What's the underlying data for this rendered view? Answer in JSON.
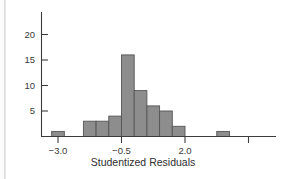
{
  "figure": {
    "background": "#ffffff",
    "width": 285,
    "height": 179
  },
  "chart_data": {
    "type": "bar",
    "subtype": "histogram",
    "title": "",
    "xlabel": "Studentized Residuals",
    "ylabel": "",
    "xlim": [
      -3.6,
      5.2
    ],
    "ylim": [
      0,
      21
    ],
    "grid": false,
    "legend": null,
    "bin_width": 0.5,
    "bin_starts": [
      -3.25,
      -2.0,
      -1.5,
      -1.0,
      -0.5,
      0.0,
      0.5,
      1.0,
      1.5,
      3.25
    ],
    "bin_centers": [
      -3.0,
      -1.75,
      -1.25,
      -0.75,
      -0.25,
      0.25,
      0.75,
      1.25,
      1.75,
      3.5
    ],
    "values": [
      1,
      3,
      3,
      4,
      16,
      9,
      6,
      5,
      2,
      1
    ],
    "categories": [
      "-3.0",
      "-1.75",
      "-1.25",
      "-0.75",
      "-0.25",
      "0.25",
      "0.75",
      "1.25",
      "1.75",
      "3.5"
    ],
    "xticks": [
      -3.0,
      -0.5,
      2.0,
      4.5
    ],
    "xticklabels": [
      "-3.0",
      "-0.5",
      "2.0",
      ""
    ],
    "yticks": [
      5,
      10,
      15,
      20
    ],
    "yticklabels": [
      "5",
      "10",
      "15",
      "20"
    ],
    "bar_fill": "#8d8d8d",
    "bar_edge": "#555555",
    "axis_color": "#3d3d3d"
  },
  "axes": {
    "x_title": "Studentized Residuals",
    "x_tick_labels": [
      "-3.0",
      "-0.5",
      "2.0"
    ],
    "y_tick_labels": [
      "20",
      "15",
      "10",
      "5"
    ]
  }
}
